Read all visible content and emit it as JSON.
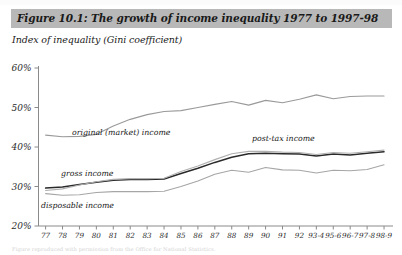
{
  "figure": {
    "title": "Figure 10.1: The growth of income inequality 1977 to 1997-98",
    "subtitle": "Index of inequality (Gini coefficient)",
    "title_band_color": "#b8b8b8",
    "bottom_caption": "Figure reproduced with permission from the Office for National Statistics."
  },
  "chart_data": {
    "type": "line",
    "title": "Figure 10.1: The growth of income inequality 1977 to 1997-98",
    "xlabel": "",
    "ylabel": "Index of inequality (Gini coefficient)",
    "ylim": [
      20,
      60
    ],
    "yticks": [
      20,
      30,
      40,
      50,
      60
    ],
    "ytick_labels": [
      "20%",
      "30%",
      "40%",
      "50%",
      "60%"
    ],
    "grid": false,
    "legend_position": "inline-annotations",
    "categories": [
      "77",
      "78",
      "79",
      "80",
      "81",
      "82",
      "83",
      "84",
      "85",
      "86",
      "87",
      "88",
      "89",
      "90",
      "91",
      "92",
      "93-4",
      "95-6",
      "96-7",
      "97-8",
      "98-9"
    ],
    "series": [
      {
        "name": "original (market) income",
        "color": "#9a9a9a",
        "width": 1.1,
        "values": [
          43.0,
          42.6,
          42.7,
          43.2,
          45.3,
          47.0,
          48.2,
          49.0,
          49.2,
          50.0,
          50.8,
          51.5,
          50.6,
          51.8,
          51.2,
          52.1,
          53.2,
          52.2,
          52.8,
          52.9,
          52.9
        ]
      },
      {
        "name": "gross income",
        "color": "#2a2a2a",
        "width": 1.5,
        "values": [
          29.6,
          29.9,
          30.5,
          31.1,
          31.6,
          31.8,
          31.8,
          31.9,
          33.3,
          34.6,
          36.1,
          37.4,
          38.3,
          38.4,
          38.3,
          38.2,
          37.7,
          38.2,
          38.0,
          38.4,
          38.8
        ]
      },
      {
        "name": "post-tax income",
        "color": "#b0b0b0",
        "width": 1.1,
        "values": [
          29.0,
          29.4,
          30.4,
          31.2,
          31.8,
          32.0,
          32.0,
          32.1,
          33.8,
          35.2,
          36.8,
          38.3,
          38.9,
          38.9,
          38.7,
          38.6,
          38.1,
          38.6,
          38.4,
          38.8,
          39.2
        ]
      },
      {
        "name": "disposable income",
        "color": "#a6a6a6",
        "width": 1.1,
        "values": [
          28.2,
          27.8,
          27.9,
          28.5,
          28.7,
          28.7,
          28.7,
          28.8,
          30.0,
          31.4,
          33.1,
          34.1,
          33.6,
          34.8,
          34.2,
          34.1,
          33.4,
          34.1,
          34.0,
          34.3,
          35.5
        ]
      }
    ],
    "annotations": [
      {
        "text": "original (market) income",
        "x_px": 72,
        "y_px": 135
      },
      {
        "text": "gross income",
        "x_px": 61,
        "y_px": 176
      },
      {
        "text": "post-tax income",
        "x_px": 252,
        "y_px": 141
      },
      {
        "text": "disposable income",
        "x_px": 41,
        "y_px": 208
      }
    ]
  }
}
